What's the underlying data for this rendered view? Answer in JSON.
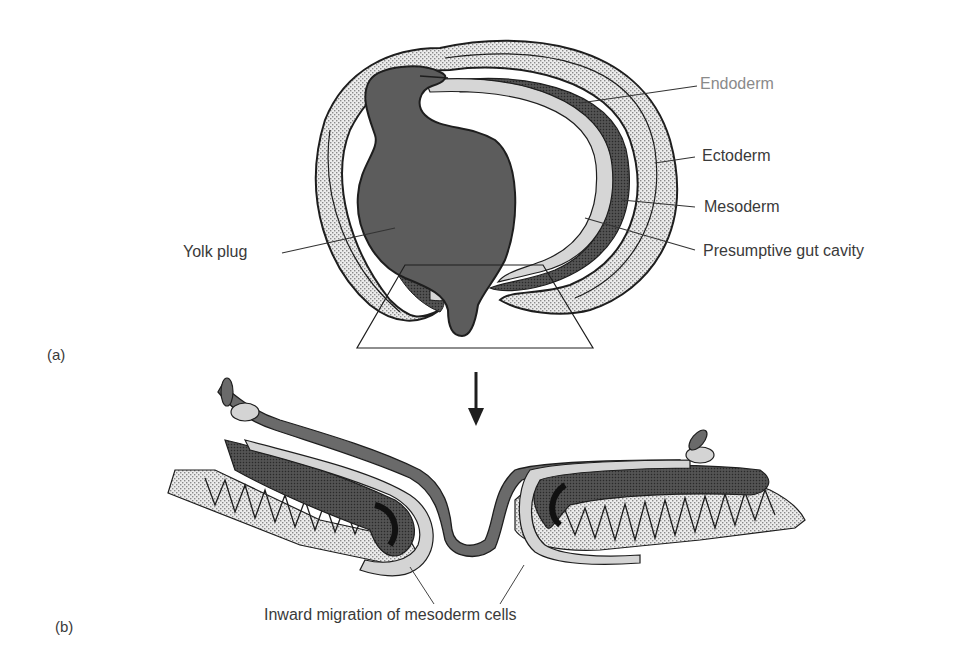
{
  "figure": {
    "panels": [
      {
        "id": "a",
        "label": "(a)"
      },
      {
        "id": "b",
        "label": "(b)"
      }
    ],
    "labels": {
      "endoderm": "Endoderm",
      "ectoderm": "Ectoderm",
      "mesoderm": "Mesoderm",
      "gut_cavity": "Presumptive gut cavity",
      "yolk_plug": "Yolk plug",
      "inward_migration": "Inward migration of mesoderm cells"
    },
    "colors": {
      "yolk": "#5e5e5e",
      "ectoderm_stipple": "#d8d8d8",
      "mesoderm": "#4a4a4a",
      "endoderm": "#cfcfcf",
      "outline": "#1e1e1e",
      "label_endoderm": "#8a8a8a"
    }
  }
}
